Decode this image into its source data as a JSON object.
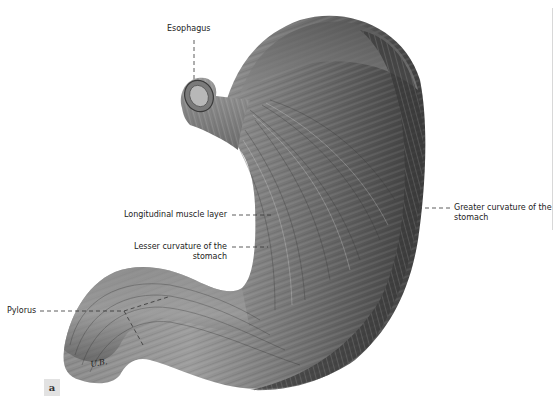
{
  "figure": {
    "panel_label": "a",
    "signature": "U.B.",
    "colors": {
      "background": "#ffffff",
      "tissue_dark": "#3a3a3a",
      "tissue_mid": "#6e6e6e",
      "tissue_light": "#a8a8a8",
      "label_text": "#222222",
      "leader_line": "#333333",
      "panel_box": "#e2e2e2"
    }
  },
  "labels": {
    "esophagus": "Esophagus",
    "longitudinal_muscle": "Longitudinal muscle layer",
    "lesser_curvature_line1": "Lesser curvature of the",
    "lesser_curvature_line2": "stomach",
    "greater_curvature_line1": "Greater curvature of the",
    "greater_curvature_line2": "stomach",
    "pylorus": "Pylorus"
  }
}
